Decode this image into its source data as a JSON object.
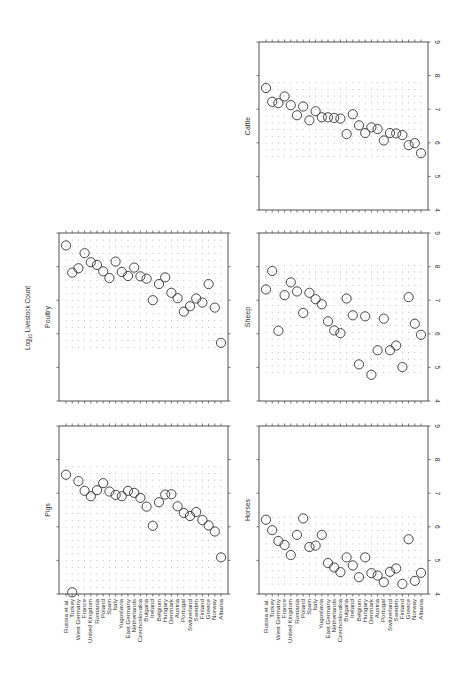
{
  "chart_data": {
    "type": "scatter",
    "subtype": "multi-panel dot plot (rotated 90°)",
    "title": "",
    "ylabel": "Log10 Livestock Count",
    "ylabel_parts": {
      "base": "Log",
      "subscript": "10",
      "rest": " Livestock Count"
    },
    "value_axis": {
      "min": 4,
      "max": 9,
      "ticks": [
        4,
        5,
        6,
        7,
        8,
        9
      ]
    },
    "grid": "dotted",
    "categories": [
      "Russia et al.",
      "Turkey",
      "West Germany",
      "France",
      "United Kingdom",
      "Romania",
      "Poland",
      "Spain",
      "Italy",
      "Yugoslavia",
      "East Germany",
      "Netherlands",
      "Czechoslovakia",
      "Bulgaria",
      "Ireland",
      "Belgium",
      "Hungary",
      "Denmark",
      "Austria",
      "Portugal",
      "Switzerland",
      "Sweden",
      "Finland",
      "Greece",
      "Norway",
      "Albania"
    ],
    "panels": [
      {
        "name": "Cattle",
        "values": [
          7.63,
          7.22,
          7.18,
          7.38,
          7.12,
          6.82,
          7.08,
          6.67,
          6.94,
          6.76,
          6.76,
          6.74,
          6.72,
          6.26,
          6.85,
          6.52,
          6.29,
          6.46,
          6.41,
          6.07,
          6.29,
          6.28,
          6.23,
          5.93,
          5.99,
          5.69
        ]
      },
      {
        "name": "Poultry",
        "values": [
          8.63,
          7.82,
          7.95,
          8.4,
          8.13,
          8.05,
          7.86,
          7.66,
          8.15,
          7.84,
          7.72,
          7.97,
          7.71,
          7.64,
          7.0,
          7.48,
          7.68,
          7.22,
          7.06,
          6.66,
          6.82,
          7.05,
          6.93,
          7.48,
          6.78,
          5.73
        ]
      },
      {
        "name": "Sheep",
        "values": [
          7.32,
          7.87,
          6.09,
          7.15,
          7.53,
          7.26,
          6.62,
          7.22,
          7.03,
          6.88,
          6.37,
          6.1,
          6.02,
          7.05,
          6.55,
          5.09,
          6.52,
          4.78,
          5.51,
          6.45,
          5.51,
          5.65,
          5.01,
          7.09,
          6.3,
          5.97
        ]
      },
      {
        "name": "Pigs",
        "values": [
          7.55,
          4.05,
          7.36,
          7.07,
          6.91,
          7.09,
          7.3,
          7.05,
          6.95,
          6.91,
          7.07,
          7.01,
          6.86,
          6.6,
          6.03,
          6.73,
          6.96,
          6.97,
          6.61,
          6.41,
          6.32,
          6.44,
          6.2,
          6.04,
          5.86,
          5.09
        ]
      },
      {
        "name": "Horses",
        "values": [
          6.21,
          5.9,
          5.58,
          5.46,
          5.16,
          5.76,
          6.25,
          5.4,
          5.44,
          5.76,
          4.92,
          4.79,
          4.65,
          5.09,
          4.85,
          4.5,
          5.09,
          4.62,
          4.55,
          4.35,
          4.66,
          4.76,
          4.3,
          5.63,
          4.39,
          4.63
        ]
      }
    ],
    "layout": "2 columns x 3 rows; left column: Poultry (middle), Pigs (bottom); right column: Cattle (top), Sheep (middle), Horses (bottom). Country labels below bottom panels, rotated vertical; value ticks 4–9 on right of right column."
  }
}
